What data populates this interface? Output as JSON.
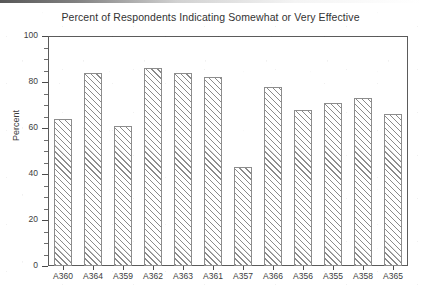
{
  "chart_data": {
    "type": "bar",
    "title": "Percent of Respondents Indicating Somewhat or Very Effective",
    "xlabel": "",
    "ylabel": "Percent",
    "categories": [
      "A360",
      "A364",
      "A359",
      "A362",
      "A363",
      "A361",
      "A357",
      "A366",
      "A356",
      "A355",
      "A358",
      "A365"
    ],
    "values": [
      64,
      84,
      61,
      86,
      84,
      82,
      43,
      78,
      68,
      71,
      73,
      66
    ],
    "ylim": [
      0,
      100
    ],
    "ytick_labels": [
      "0",
      "20",
      "40",
      "60",
      "80",
      "100"
    ],
    "ytick_values": [
      0,
      20,
      40,
      60,
      80,
      100
    ],
    "yminor_step": 5,
    "grid": false,
    "legend": null,
    "bar_style": {
      "fill": "#ffffff",
      "hatch": "diagonal-forward",
      "hatch_color": "#8a8a8a",
      "edge_color": "#8d8d8d"
    },
    "axis_color": "#5b5b5b",
    "text_color": "#333333",
    "background": "#ffffff"
  }
}
